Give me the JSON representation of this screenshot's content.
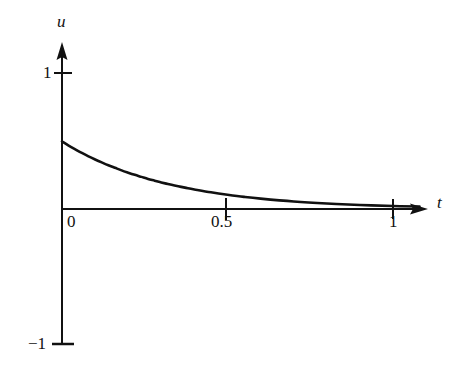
{
  "chart_data": {
    "type": "line",
    "title": "",
    "subtitle": "",
    "xlabel": "t",
    "ylabel": "u",
    "xlim": [
      0,
      1.1
    ],
    "ylim": [
      -1,
      1
    ],
    "grid": false,
    "legend": null,
    "annotations": [],
    "x_ticks": [
      {
        "value": 0,
        "label": "0"
      },
      {
        "value": 0.5,
        "label": "0.5"
      },
      {
        "value": 1,
        "label": "1"
      }
    ],
    "y_ticks": [
      {
        "value": 1,
        "label": "1"
      },
      {
        "value": -1,
        "label": "−1"
      }
    ],
    "series": [
      {
        "name": "u(t)",
        "color": "#111111",
        "x": [
          0.0,
          0.02,
          0.04,
          0.06,
          0.08,
          0.1,
          0.12,
          0.14,
          0.16,
          0.18,
          0.2,
          0.22,
          0.24,
          0.26,
          0.28,
          0.3,
          0.32,
          0.34,
          0.36,
          0.38,
          0.4,
          0.45,
          0.5,
          0.55,
          0.6,
          0.7,
          0.8,
          0.9,
          1.0,
          1.08
        ],
        "y": [
          -0.5,
          -0.47,
          -0.442,
          -0.415,
          -0.39,
          -0.367,
          -0.345,
          -0.324,
          -0.305,
          -0.286,
          -0.269,
          -0.253,
          -0.238,
          -0.223,
          -0.21,
          -0.197,
          -0.185,
          -0.174,
          -0.164,
          -0.154,
          -0.145,
          -0.124,
          -0.106,
          -0.09,
          -0.077,
          -0.056,
          -0.041,
          -0.03,
          -0.022,
          -0.018
        ]
      }
    ]
  },
  "labels": {
    "y_axis": "u",
    "x_axis": "t",
    "y_top": "1",
    "y_bottom": "−1",
    "x_origin": "0",
    "x_mid": "0.5",
    "x_end": "1"
  },
  "style": {
    "background": "#ffffff",
    "axis_color": "#111111",
    "curve_color": "#111111"
  }
}
